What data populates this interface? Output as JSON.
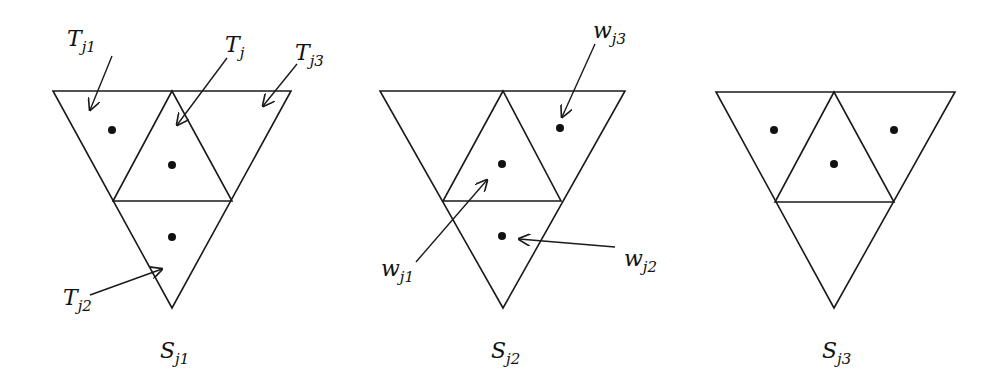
{
  "figure": {
    "panels": [
      {
        "caption": {
          "base": "S",
          "sub": "j1"
        },
        "outer_triangle": {
          "top_left": [
            53,
            91
          ],
          "top_right": [
            291,
            91
          ],
          "bottom": [
            172,
            308
          ]
        },
        "dots": [
          [
            112,
            130
          ],
          [
            172,
            165
          ],
          [
            172,
            237
          ]
        ],
        "labels": [
          {
            "base": "T",
            "sub": "j1",
            "x": 67,
            "y": 46
          },
          {
            "base": "T",
            "sub": "j",
            "x": 225,
            "y": 52
          },
          {
            "base": "T",
            "sub": "j3",
            "x": 295,
            "y": 60
          },
          {
            "base": "T",
            "sub": "j2",
            "x": 63,
            "y": 305
          }
        ]
      },
      {
        "caption": {
          "base": "S",
          "sub": "j2"
        },
        "outer_triangle": {
          "top_left": [
            380,
            91
          ],
          "top_right": [
            625,
            91
          ],
          "bottom": [
            503,
            308
          ]
        },
        "dots": [
          [
            560,
            128
          ],
          [
            502,
            164
          ],
          [
            502,
            236
          ]
        ],
        "labels": [
          {
            "base": "w",
            "sub": "j3",
            "x": 593,
            "y": 38
          },
          {
            "base": "w",
            "sub": "j1",
            "x": 381,
            "y": 276
          },
          {
            "base": "w",
            "sub": "j2",
            "x": 624,
            "y": 266
          }
        ]
      },
      {
        "caption": {
          "base": "S",
          "sub": "j3"
        },
        "outer_triangle": {
          "top_left": [
            716,
            92
          ],
          "top_right": [
            955,
            92
          ],
          "bottom": [
            834,
            308
          ]
        },
        "dots": [
          [
            774,
            130
          ],
          [
            834,
            164
          ],
          [
            894,
            130
          ]
        ],
        "labels": []
      }
    ]
  }
}
